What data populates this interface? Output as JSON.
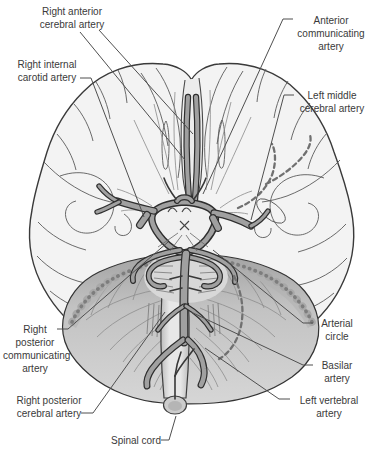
{
  "figure": {
    "background": "#ffffff"
  },
  "colors": {
    "background": "#ffffff",
    "label_color": "#3a3a3a",
    "leader_color": "#4f4f4f",
    "vessel_outline": "#2e2e2e",
    "vessel_fill": "#a0a0a0",
    "cerebrum_fill": "#f3f3f3",
    "cerebellum_fill": "#bdbdbd"
  },
  "labels": [
    {
      "id": "right-anterior-cerebral-artery",
      "text": "Right anterior\ncerebral artery"
    },
    {
      "id": "anterior-communicating-artery",
      "text": "Anterior\ncommunicating\nartery"
    },
    {
      "id": "right-internal-carotid-artery",
      "text": "Right internal\ncarotid artery"
    },
    {
      "id": "left-middle-cerebral-artery",
      "text": "Left middle\ncerebral artery"
    },
    {
      "id": "right-posterior-communicating-artery",
      "text": "Right\nposterior\ncommunicating\nartery"
    },
    {
      "id": "right-posterior-cerebral-artery",
      "text": "Right posterior\ncerebral artery"
    },
    {
      "id": "arterial-circle",
      "text": "Arterial\ncircle"
    },
    {
      "id": "basilar-artery",
      "text": "Basilar\nartery"
    },
    {
      "id": "left-vertebral-artery",
      "text": "Left vertebral\nartery"
    },
    {
      "id": "spinal-cord",
      "text": "Spinal cord"
    }
  ]
}
